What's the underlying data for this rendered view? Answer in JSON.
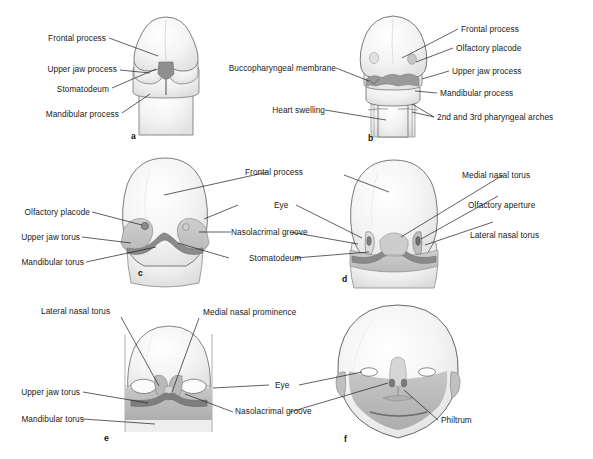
{
  "figure": {
    "domain": "anatomical-diagram",
    "background_color": "#ffffff",
    "ink_color": "#1c1c1c",
    "fill_light": "#f2f2f2",
    "fill_mid": "#c9c9c9",
    "fill_dark": "#8a8a8a",
    "panel_count": 6
  },
  "panels": [
    {
      "letter": "a",
      "stage": 1,
      "labels_left": [
        {
          "text": "Frontal process"
        },
        {
          "text": "Upper jaw process"
        },
        {
          "text": "Stomatodeum"
        },
        {
          "text": "Mandibular process"
        }
      ],
      "labels_right": []
    },
    {
      "letter": "b",
      "stage": 2,
      "labels_left": [
        {
          "text": "Buccopharyngeal membrane"
        },
        {
          "text": "Heart swelling"
        }
      ],
      "labels_right": [
        {
          "text": "Frontal process"
        },
        {
          "text": "Olfactory placode"
        },
        {
          "text": "Upper jaw process"
        },
        {
          "text": "Mandibular process"
        },
        {
          "text": "2nd and 3rd pharyngeal arches"
        }
      ]
    },
    {
      "letter": "c",
      "stage": 3,
      "labels_left": [
        {
          "text": "Olfactory placode"
        },
        {
          "text": "Upper jaw torus"
        },
        {
          "text": "Mandibular torus"
        }
      ],
      "labels_right": [
        {
          "text": "Frontal process"
        },
        {
          "text": "Eye"
        },
        {
          "text": "Nasolacrimal groove"
        },
        {
          "text": "Stomatodeum"
        }
      ]
    },
    {
      "letter": "d",
      "stage": 4,
      "labels_left": [
        {
          "text": "Frontal process"
        },
        {
          "text": "Eye"
        },
        {
          "text": "Nasolacrimal groove"
        },
        {
          "text": "Stomatodeum"
        }
      ],
      "labels_right": [
        {
          "text": "Medial nasal torus"
        },
        {
          "text": "Olfactory aperture"
        },
        {
          "text": "Lateral nasal torus"
        }
      ]
    },
    {
      "letter": "e",
      "stage": 5,
      "labels_left": [
        {
          "text": "Lateral nasal torus"
        },
        {
          "text": "Medial nasal prominence"
        },
        {
          "text": "Upper jaw torus"
        },
        {
          "text": "Mandibular torus"
        }
      ],
      "labels_right": []
    },
    {
      "letter": "f",
      "stage": 6,
      "labels_left": [
        {
          "text": "Eye"
        },
        {
          "text": "Nasolacrimal groove"
        }
      ],
      "labels_right": [
        {
          "text": "Philtrum"
        }
      ]
    }
  ],
  "text": {
    "frontal_process": "Frontal process",
    "upper_jaw_process": "Upper jaw process",
    "stomatodeum": "Stomatodeum",
    "mandibular_process": "Mandibular process",
    "buccopharyngeal_membrane": "Buccopharyngeal membrane",
    "heart_swelling": "Heart swelling",
    "olfactory_placode": "Olfactory placode",
    "pharyngeal_arches": "2nd and 3rd pharyngeal arches",
    "eye": "Eye",
    "nasolacrimal_groove": "Nasolacrimal groove",
    "upper_jaw_torus": "Upper jaw torus",
    "mandibular_torus": "Mandibular torus",
    "medial_nasal_torus": "Medial nasal torus",
    "olfactory_aperture": "Olfactory aperture",
    "lateral_nasal_torus": "Lateral nasal torus",
    "medial_nasal_prominence": "Medial nasal prominence",
    "philtrum": "Philtrum",
    "letter_a": "a",
    "letter_b": "b",
    "letter_c": "c",
    "letter_d": "d",
    "letter_e": "e",
    "letter_f": "f"
  }
}
